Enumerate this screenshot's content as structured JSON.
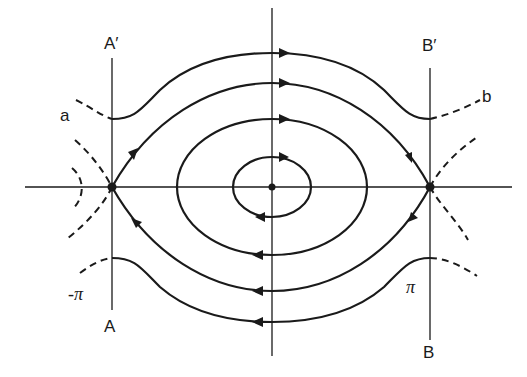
{
  "figure": {
    "labels": {
      "A_prime": "A′",
      "B_prime": "B′",
      "A": "A",
      "B": "B",
      "a": "a",
      "b": "b",
      "neg_pi": "-π",
      "pi": "π"
    },
    "caption": "Figure 1.2.3  Phase portrait"
  },
  "elements": {
    "axes": [
      "horizontal-axis",
      "vertical-axis"
    ],
    "vertical_lines": [
      "line-A",
      "line-B"
    ],
    "equilibria": [
      {
        "name": "saddle-A",
        "type": "saddle",
        "x_label": "-π"
      },
      {
        "name": "center",
        "type": "center",
        "x_label": "0"
      },
      {
        "name": "saddle-B",
        "type": "saddle",
        "x_label": "π"
      }
    ],
    "closed_orbits": 2,
    "separatrices": [
      "upper-separatrix",
      "lower-separatrix"
    ],
    "rotating_orbits": [
      "upper-rotating-orbit",
      "lower-rotating-orbit"
    ],
    "dashed_curves": [
      "dashed-a",
      "dashed-b",
      "dashed-left-inner",
      "dashed-right-inner",
      "dashed-left-bottom",
      "dashed-right-bottom"
    ],
    "flow_direction": "clockwise"
  },
  "colors": {
    "ink": "#1a1a1a",
    "background": "#ffffff"
  }
}
